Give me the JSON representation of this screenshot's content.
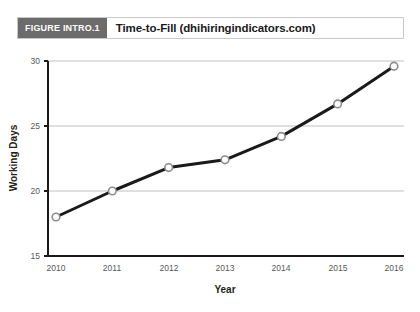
{
  "header": {
    "tag": "FIGURE INTRO.1",
    "title": "Time-to-Fill (dhihiringindicators.com)",
    "tag_bg": "#6b6b6b",
    "border_color": "#c9c9c9"
  },
  "chart_data": {
    "type": "line",
    "title": "Time-to-Fill (dhihiringindicators.com)",
    "xlabel": "Year",
    "ylabel": "Working Days",
    "categories": [
      "2010",
      "2011",
      "2012",
      "2013",
      "2014",
      "2015",
      "2016"
    ],
    "values": [
      18.0,
      20.0,
      21.8,
      22.4,
      24.2,
      26.7,
      29.6
    ],
    "x": [
      2010,
      2011,
      2012,
      2013,
      2014,
      2015,
      2016
    ],
    "xlim": [
      2010,
      2016
    ],
    "ylim": [
      15,
      30
    ],
    "yticks": [
      15,
      20,
      25,
      30
    ],
    "xticks": [
      "2010",
      "2011",
      "2012",
      "2013",
      "2014",
      "2015",
      "2016"
    ],
    "grid": "horizontal",
    "legend": "none",
    "line_color": "#1a1a1a",
    "marker_fill": "#ffffff",
    "marker_stroke": "#8c8c8c",
    "gridline_color": "#b0b0b0"
  }
}
